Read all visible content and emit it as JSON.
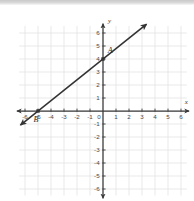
{
  "figure": {
    "kind": "coordinate-plane-line-graph",
    "top_band_color": "#d2d2d2",
    "background_color": "#ffffff"
  },
  "chart_data": {
    "type": "line",
    "title": "",
    "subtitle": "",
    "xlabel": "x",
    "ylabel": "y",
    "xlim": [
      -6.6,
      6.6
    ],
    "ylim": [
      -6.6,
      6.9
    ],
    "grid": true,
    "grid_color": "#e3e3e3",
    "axis_color": "#3a3a3a",
    "line_color": "#333333",
    "legend": "none",
    "x_ticks": [
      -6,
      -5,
      -4,
      -3,
      -2,
      -1,
      0,
      1,
      2,
      3,
      4,
      5,
      6
    ],
    "x_tick_labels": [
      "-6",
      "-5",
      "-4",
      "-3",
      "-2",
      "-1",
      "0",
      "1",
      "2",
      "3",
      "4",
      "5",
      "6"
    ],
    "y_ticks": [
      -6,
      -5,
      -4,
      -3,
      -2,
      -1,
      1,
      2,
      3,
      4,
      5,
      6
    ],
    "y_tick_labels": [
      "-6",
      "-5",
      "-4",
      "-3",
      "-2",
      "-1",
      "1",
      "2",
      "3",
      "4",
      "5",
      "6"
    ],
    "origin_label": "0",
    "series": [
      {
        "name": "line-AB",
        "kind": "line",
        "slope": 0.8,
        "intercept": 4,
        "equation": "y = 4/5 x + 4",
        "x_start": -6.35,
        "x_end": 3.35,
        "arrow_start": true,
        "arrow_end": true,
        "color": "#333333"
      }
    ],
    "points": [
      {
        "label": "A",
        "x": 0,
        "y": 4,
        "label_dx": 0.55,
        "label_dy": -0.45
      },
      {
        "label": "B",
        "x": -5,
        "y": 0,
        "label_dx": -0.15,
        "label_dy": 0.85
      }
    ],
    "annotations": [
      {
        "text": "x",
        "x": 6.4,
        "y": 0.55,
        "style": "axis-name"
      },
      {
        "text": "y",
        "x": 0.5,
        "y": 6.75,
        "style": "axis-name"
      }
    ]
  }
}
